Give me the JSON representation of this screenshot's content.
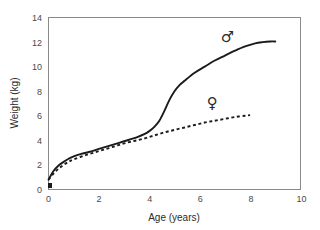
{
  "chart_data": {
    "type": "line",
    "title": "",
    "xlabel": "Age (years)",
    "ylabel": "Weight (kg)",
    "xlim": [
      0,
      10
    ],
    "ylim": [
      0,
      14
    ],
    "xticks": [
      "0",
      "2",
      "4",
      "6",
      "8",
      "10"
    ],
    "yticks": [
      "0",
      "2",
      "4",
      "6",
      "8",
      "10",
      "12",
      "14"
    ],
    "xtick_values": [
      0,
      2,
      4,
      6,
      8,
      10
    ],
    "ytick_values": [
      0,
      2,
      4,
      6,
      8,
      10,
      12,
      14
    ],
    "grid": false,
    "legend_position": "inline-annotation",
    "series": [
      {
        "name": "male",
        "symbol": "♂",
        "style": "solid",
        "color": "#1b1b1b",
        "annotation_label": "♂",
        "annotation_x": 7.1,
        "annotation_y": 12.0,
        "x": [
          0.0,
          0.2,
          0.4,
          0.6,
          0.8,
          1.0,
          1.3,
          1.6,
          2.0,
          2.4,
          2.8,
          3.2,
          3.5,
          3.8,
          4.0,
          4.2,
          4.4,
          4.6,
          4.8,
          5.0,
          5.2,
          5.4,
          5.8,
          6.2,
          6.6,
          7.0,
          7.4,
          7.8,
          8.2,
          8.5,
          8.8,
          9.0
        ],
        "y": [
          0.8,
          1.5,
          1.95,
          2.25,
          2.5,
          2.7,
          2.9,
          3.05,
          3.3,
          3.55,
          3.8,
          4.05,
          4.25,
          4.5,
          4.75,
          5.1,
          5.6,
          6.4,
          7.3,
          8.0,
          8.5,
          8.85,
          9.5,
          10.0,
          10.5,
          10.9,
          11.3,
          11.65,
          11.9,
          12.0,
          12.05,
          12.05
        ]
      },
      {
        "name": "female",
        "symbol": "♀",
        "style": "dashed",
        "color": "#1b1b1b",
        "annotation_label": "♀",
        "annotation_x": 6.5,
        "annotation_y": 6.6,
        "x": [
          0.0,
          0.2,
          0.4,
          0.6,
          0.8,
          1.0,
          1.4,
          1.8,
          2.2,
          2.6,
          3.0,
          3.4,
          3.8,
          4.2,
          4.6,
          5.0,
          5.4,
          5.8,
          6.2,
          6.6,
          7.0,
          7.4,
          7.8,
          8.0
        ],
        "y": [
          0.8,
          1.3,
          1.7,
          2.0,
          2.25,
          2.45,
          2.75,
          3.0,
          3.25,
          3.5,
          3.75,
          3.95,
          4.15,
          4.4,
          4.65,
          4.85,
          5.05,
          5.25,
          5.45,
          5.6,
          5.75,
          5.9,
          6.0,
          6.05
        ]
      }
    ]
  },
  "axes": {
    "x_title": "Age (years)",
    "y_title": "Weight (kg)"
  },
  "annotations": {
    "male_symbol": "♂",
    "female_symbol": "♀"
  }
}
